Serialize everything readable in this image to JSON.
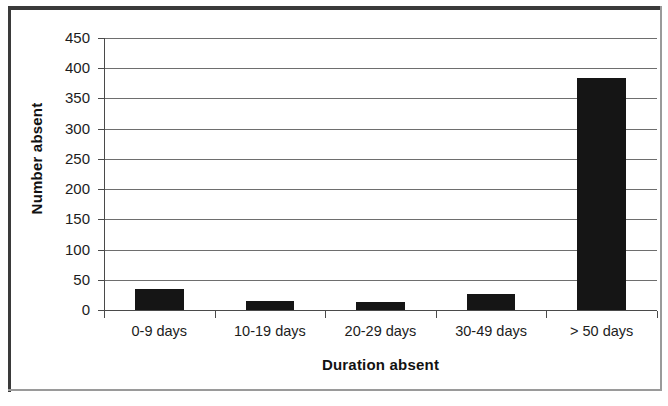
{
  "chart_data": {
    "type": "bar",
    "title": "",
    "xlabel": "Duration absent",
    "ylabel": "Number absent",
    "categories": [
      "0-9 days",
      "10-19 days",
      "20-29 days",
      "30-49 days",
      "> 50 days"
    ],
    "values": [
      35,
      15,
      13,
      26,
      384
    ],
    "ylim": [
      0,
      450
    ],
    "yticks": [
      0,
      50,
      100,
      150,
      200,
      250,
      300,
      350,
      400,
      450
    ],
    "ytick_labels": [
      "0",
      "50",
      "100",
      "150",
      "200",
      "250",
      "300",
      "350",
      "400",
      "450"
    ],
    "grid": true,
    "grid_axis": "y",
    "legend": null,
    "bar_color": "#151515",
    "gridline_color": "#6e6e6e",
    "axis_color": "#4a4a4a",
    "background_color": "#ffffff",
    "series": [
      {
        "name": "Number absent",
        "values": [
          35,
          15,
          13,
          26,
          384
        ]
      }
    ]
  },
  "frame": {
    "border_color_dark": "#3a3a3a",
    "border_color_light": "#9a9a9a"
  }
}
